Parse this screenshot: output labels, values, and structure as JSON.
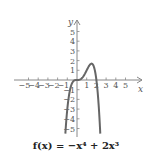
{
  "chart_data": {
    "type": "line",
    "title": "",
    "caption": "f(x) = −x⁴ + 2x³",
    "function": "-x^4 + 2x^3",
    "xlabel": "x",
    "ylabel": "y",
    "xlim": [
      -5,
      5
    ],
    "ylim": [
      -5,
      5
    ],
    "x_ticks": [
      -5,
      -4,
      -3,
      -2,
      -1,
      1,
      2,
      3,
      4,
      5
    ],
    "y_ticks": [
      -5,
      -4,
      -3,
      -2,
      -1,
      1,
      2,
      3,
      4,
      5
    ],
    "grid": false,
    "series": [
      {
        "name": "f(x)",
        "x": [
          -1.2,
          -1.0,
          -0.8,
          -0.5,
          -0.25,
          0,
          0.25,
          0.5,
          0.75,
          1.0,
          1.25,
          1.5,
          1.75,
          2.0,
          2.2,
          2.4
        ],
        "values": [
          -5.53,
          -3.0,
          -1.43,
          -0.31,
          -0.035,
          0,
          0.027,
          0.19,
          0.53,
          1.0,
          1.46,
          1.69,
          1.34,
          0,
          -2.0,
          -5.53
        ]
      }
    ],
    "key_points": {
      "local_max": [
        1.5,
        1.69
      ],
      "roots": [
        0,
        2
      ]
    },
    "colors": {
      "curve": "#666666",
      "axes": "#888888",
      "text": "#555555"
    }
  }
}
